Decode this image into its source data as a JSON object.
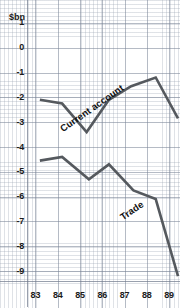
{
  "chart_data": {
    "type": "line",
    "title": "",
    "subtitle": "",
    "xlabel": "",
    "ylabel": "$bn",
    "unit_label": "$bn",
    "x": [
      83,
      84,
      85,
      86,
      87,
      88,
      89
    ],
    "xtick_labels": [
      "83",
      "84",
      "85",
      "86",
      "87",
      "88",
      "89"
    ],
    "ytick_labels": [
      "1",
      "0",
      "-1",
      "-2",
      "-3",
      "-4",
      "-5",
      "-6",
      "-7",
      "-8",
      "-9"
    ],
    "ytick_values": [
      1,
      0,
      -1,
      -2,
      -3,
      -4,
      -5,
      -6,
      -7,
      -8,
      -9
    ],
    "ylim": [
      -9.4,
      1.6
    ],
    "xlim": [
      82.6,
      89.4
    ],
    "grid": true,
    "grid_style": "graph-paper",
    "legend": "inline-annotations",
    "legend_position": "inline",
    "line_color": "#55595e",
    "series": [
      {
        "name": "Current account",
        "label": "Current account",
        "x": [
          83.2,
          84.2,
          85.3,
          86.3,
          87.3,
          88.4,
          89.4
        ],
        "values": [
          -2.1,
          -2.25,
          -3.4,
          -2.1,
          -1.55,
          -1.2,
          -2.85
        ]
      },
      {
        "name": "Trade",
        "label": "Trade",
        "x": [
          83.2,
          84.2,
          85.4,
          86.3,
          87.4,
          88.4,
          89.4
        ],
        "values": [
          -4.55,
          -4.4,
          -5.3,
          -4.7,
          -5.75,
          -6.1,
          -9.2
        ]
      }
    ],
    "annotations": [
      {
        "text": "Current account",
        "rotation": -35
      },
      {
        "text": "Trade",
        "rotation": -34
      }
    ]
  }
}
